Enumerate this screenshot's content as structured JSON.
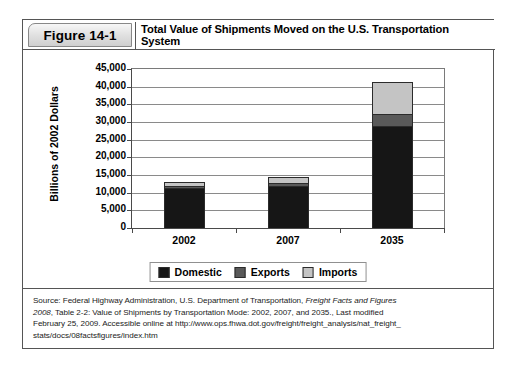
{
  "figure": {
    "tag": "Figure 14-1",
    "title": "Total Value of Shipments Moved on the U.S. Transportation System"
  },
  "source_note": {
    "line1_prefix": "Source: Federal Highway Administration, U.S. Department of Transportation, ",
    "line1_italic": "Freight Facts and Figures",
    "line2_italic": "2008",
    "line2_rest": ", Table 2-2: Value of Shipments by Transportation Mode: 2002, 2007, and 2035., Last modified",
    "line3": "February 25, 2009. Accessible online at http://www.ops.fhwa.dot.gov/freight/freight_analysis/nat_freight_",
    "line4": "stats/docs/08factsfigures/index.htm"
  },
  "chart_data": {
    "type": "bar",
    "stacked": true,
    "title": "Total Value of Shipments Moved on the U.S. Transportation System",
    "xlabel": "",
    "ylabel": "Billions of 2002 Dollars",
    "ylim": [
      0,
      45000
    ],
    "ytick_step": 5000,
    "ytick_labels": [
      "45,000",
      "40,000",
      "35,000",
      "30,000",
      "25,000",
      "20,000",
      "15,000",
      "10,000",
      "5,000",
      "0"
    ],
    "ytick_values": [
      45000,
      40000,
      35000,
      30000,
      25000,
      20000,
      15000,
      10000,
      5000,
      0
    ],
    "grid": true,
    "legend_position": "bottom-center",
    "categories": [
      "2002",
      "2007",
      "2035"
    ],
    "series": [
      {
        "name": "Domestic",
        "color": "#161616",
        "values": [
          11200,
          12000,
          29000
        ]
      },
      {
        "name": "Exports",
        "color": "#595959",
        "values": [
          700,
          800,
          3300
        ]
      },
      {
        "name": "Imports",
        "color": "#c4c4c4",
        "values": [
          1100,
          1700,
          9000
        ]
      }
    ],
    "totals": [
      13000,
      14500,
      41300
    ]
  }
}
